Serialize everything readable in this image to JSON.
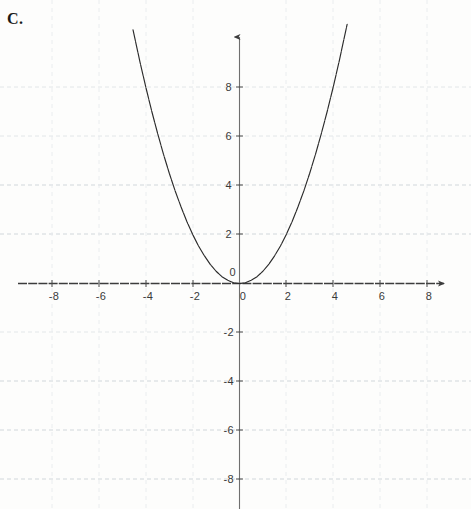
{
  "problem": {
    "label": "C."
  },
  "chart_data": {
    "type": "line",
    "title": "",
    "subtitle": "",
    "xlabel": "",
    "ylabel": "",
    "equation": "y = 0.5x^2",
    "curve_description": "upward-opening parabola with vertex at the origin",
    "xlim": [
      -9.4,
      8.8
    ],
    "ylim": [
      -9.3,
      10.8
    ],
    "x_ticks": [
      -8,
      -6,
      -4,
      -2,
      0,
      2,
      4,
      6,
      8
    ],
    "y_ticks": [
      8,
      6,
      4,
      2,
      0,
      -2,
      -4,
      -6,
      -8
    ],
    "x_tick_labels": [
      "-8",
      "-6",
      "-4",
      "-2",
      "0",
      "2",
      "4",
      "6",
      "8"
    ],
    "y_tick_labels": [
      "8",
      "6",
      "4",
      "2",
      "0",
      "-2",
      "-4",
      "-6",
      "-8"
    ],
    "origin_label": "0",
    "grid": true,
    "grid_step": 2,
    "legend": "none",
    "x": [
      -4.55,
      -4.25,
      -4.0,
      -3.75,
      -3.5,
      -3.25,
      -3.0,
      -2.75,
      -2.5,
      -2.25,
      -2.0,
      -1.75,
      -1.5,
      -1.25,
      -1.0,
      -0.75,
      -0.5,
      -0.25,
      0.0,
      0.25,
      0.5,
      0.75,
      1.0,
      1.25,
      1.5,
      1.75,
      2.0,
      2.25,
      2.5,
      2.75,
      3.0,
      3.25,
      3.5,
      3.75,
      4.0,
      4.25,
      4.6
    ],
    "y": [
      10.35,
      9.03,
      8.0,
      7.03,
      6.13,
      5.28,
      4.5,
      3.78,
      3.13,
      2.53,
      2.0,
      1.53,
      1.13,
      0.78,
      0.5,
      0.28,
      0.13,
      0.03,
      0.0,
      0.03,
      0.13,
      0.28,
      0.5,
      0.78,
      1.13,
      1.53,
      2.0,
      2.53,
      3.13,
      3.78,
      4.5,
      5.28,
      6.13,
      7.03,
      8.0,
      9.03,
      10.58
    ],
    "key_points": [
      {
        "x": 0,
        "y": 0,
        "note": "vertex"
      },
      {
        "x": 2,
        "y": 2
      },
      {
        "x": -2,
        "y": 2
      },
      {
        "x": 4,
        "y": 8
      },
      {
        "x": -4,
        "y": 8
      }
    ],
    "colors": {
      "curve": "#2b2b2b",
      "axis": "#3c3c3c",
      "grid": "#c9cfd6",
      "grid_faint": "#e3e6ea",
      "text": "#3a3a3a"
    }
  }
}
